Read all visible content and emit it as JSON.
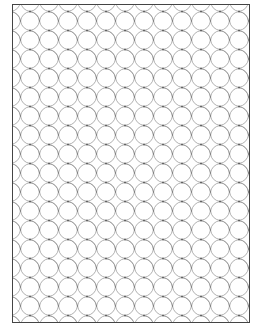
{
  "page": {
    "pattern": {
      "tile_size": 19,
      "stroke_color": "#8a8a8a",
      "dot_color": "#555555",
      "border_color": "#444444"
    }
  }
}
